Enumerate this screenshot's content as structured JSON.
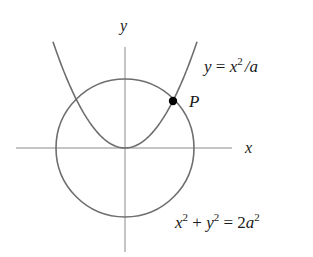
{
  "figure": {
    "width": 313,
    "height": 257,
    "colors": {
      "background": "#ffffff",
      "axis": "#8a8a8a",
      "curve": "#6e6e6e",
      "point": "#000000",
      "text": "#1a1a1a"
    },
    "axes": {
      "x_label": "x",
      "y_label": "y",
      "origin_px": [
        125,
        148
      ],
      "x_axis_px": [
        16,
        232
      ],
      "y_axis_px": [
        47,
        252
      ]
    },
    "circle": {
      "equation_parts": {
        "x": "x",
        "x_exp": "2",
        "plus": " + ",
        "y": "y",
        "y_exp": "2",
        "equals": " = 2",
        "a": "a",
        "a_exp": "2"
      },
      "equation": "x² + y² = 2a²",
      "radius_px": 69
    },
    "parabola": {
      "equation_parts": {
        "y": "y",
        "equals": " = ",
        "x": "x",
        "x_exp": "2",
        "slash": "/",
        "a": "a"
      },
      "equation": "y = x²/a",
      "a_px": 48.8
    },
    "point": {
      "label": "P",
      "px": [
        173,
        101
      ]
    }
  }
}
